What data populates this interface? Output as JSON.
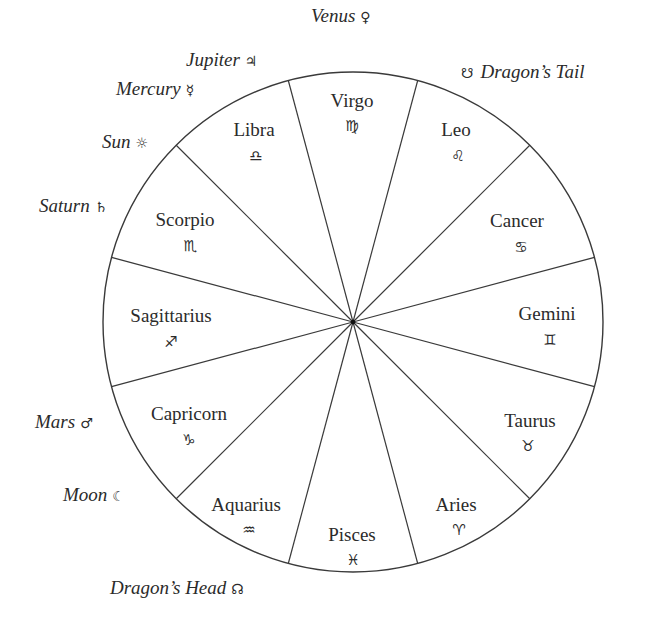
{
  "wheel": {
    "center": [
      353,
      322
    ],
    "radius": 250,
    "stroke_color": "#3a3a3a",
    "spoke_angles_deg": [
      15,
      45,
      75,
      105,
      135,
      165,
      195,
      225,
      255,
      285,
      315,
      345
    ]
  },
  "signs": [
    {
      "name": "Virgo",
      "glyph": "♍",
      "x": 352,
      "y": 101,
      "gx": 352,
      "gy": 126
    },
    {
      "name": "Leo",
      "glyph": "♌",
      "x": 456,
      "y": 130,
      "gx": 458,
      "gy": 156
    },
    {
      "name": "Cancer",
      "glyph": "♋",
      "x": 517,
      "y": 221,
      "gx": 521,
      "gy": 247
    },
    {
      "name": "Gemini",
      "glyph": "♊",
      "x": 547,
      "y": 314,
      "gx": 550,
      "gy": 340
    },
    {
      "name": "Taurus",
      "glyph": "♉",
      "x": 530,
      "y": 421,
      "gx": 528,
      "gy": 446
    },
    {
      "name": "Aries",
      "glyph": "♈",
      "x": 456,
      "y": 505,
      "gx": 459,
      "gy": 530
    },
    {
      "name": "Pisces",
      "glyph": "♓",
      "x": 352,
      "y": 535,
      "gx": 353,
      "gy": 560
    },
    {
      "name": "Aquarius",
      "glyph": "♒",
      "x": 246,
      "y": 505,
      "gx": 249,
      "gy": 530
    },
    {
      "name": "Capricorn",
      "glyph": "♑",
      "x": 189,
      "y": 414,
      "gx": 189,
      "gy": 440
    },
    {
      "name": "Sagittarius",
      "glyph": "♐",
      "x": 171,
      "y": 316,
      "gx": 171,
      "gy": 342
    },
    {
      "name": "Scorpio",
      "glyph": "♏",
      "x": 185,
      "y": 220,
      "gx": 190,
      "gy": 246
    },
    {
      "name": "Libra",
      "glyph": "♎",
      "x": 254,
      "y": 130,
      "gx": 256,
      "gy": 156
    }
  ],
  "planets": [
    {
      "name": "Venus",
      "glyph": "♀",
      "x": 311,
      "y": 16,
      "glyph_first": false
    },
    {
      "name": "Jupiter",
      "glyph": "♃",
      "x": 186,
      "y": 60,
      "glyph_first": false
    },
    {
      "name": "Mercury",
      "glyph": "☿",
      "x": 116,
      "y": 89,
      "glyph_first": false
    },
    {
      "name": "Sun",
      "glyph": "☼",
      "x": 102,
      "y": 142,
      "glyph_first": false
    },
    {
      "name": "Saturn",
      "glyph": "♄",
      "x": 39,
      "y": 206,
      "glyph_first": false
    },
    {
      "name": "Dragon’s Tail",
      "glyph": "☋",
      "x": 461,
      "y": 72,
      "glyph_first": true
    },
    {
      "name": "Mars",
      "glyph": "♂",
      "x": 35,
      "y": 422,
      "glyph_first": false
    },
    {
      "name": "Moon",
      "glyph": "☾",
      "x": 63,
      "y": 495,
      "glyph_first": false
    },
    {
      "name": "Dragon’s Head",
      "glyph": "☊",
      "x": 110,
      "y": 588,
      "glyph_first": false
    }
  ]
}
